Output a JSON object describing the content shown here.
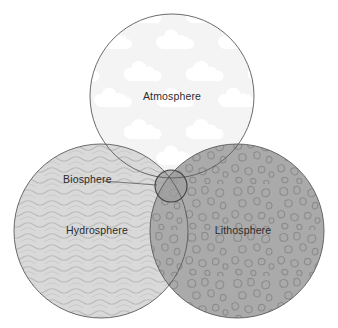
{
  "diagram": {
    "type": "venn",
    "background_color": "#ffffff",
    "outline_color": "#5a5a5a",
    "label_color": "#2b2b2b",
    "circles": [
      {
        "id": "atmosphere",
        "label": "Atmosphere",
        "cx": 172,
        "cy": 96,
        "r": 82,
        "fill_color": "#f5f5f5",
        "pattern": "clouds",
        "pattern_color": "#ffffff",
        "label_x": 172,
        "label_y": 97
      },
      {
        "id": "hydrosphere",
        "label": "Hydrosphere",
        "cx": 101,
        "cy": 231,
        "r": 87,
        "fill_color": "#d8d8d8",
        "pattern": "waves",
        "pattern_color": "#b9b9b9",
        "label_x": 97,
        "label_y": 231
      },
      {
        "id": "lithosphere",
        "label": "Lithosphere",
        "cx": 237,
        "cy": 231,
        "r": 87,
        "fill_color": "#a9a9a9",
        "pattern": "pebbles",
        "pattern_color": "#8e8e8e",
        "label_x": 243,
        "label_y": 231
      },
      {
        "id": "biosphere",
        "label": "Biosphere",
        "cx": 171,
        "cy": 186,
        "r": 16,
        "fill_color": "#9a9a9a",
        "pattern": "none",
        "pattern_color": "#9a9a9a",
        "label_x": 63,
        "label_y": 179
      }
    ],
    "leader_line": {
      "from_x": 118,
      "from_y": 181,
      "to_x": 157,
      "to_y": 185
    }
  }
}
